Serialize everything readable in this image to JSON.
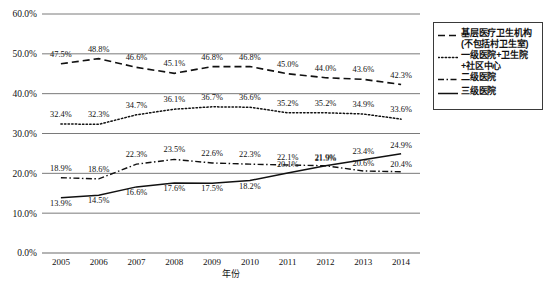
{
  "chart_data": {
    "type": "line",
    "title": "",
    "xlabel": "年份",
    "ylabel": "",
    "categories": [
      "2005",
      "2006",
      "2007",
      "2008",
      "2009",
      "2010",
      "2011",
      "2012",
      "2013",
      "2014"
    ],
    "ylim": [
      0,
      60
    ],
    "ytick_labels": [
      "0.0%",
      "10.0%",
      "20.0%",
      "30.0%",
      "40.0%",
      "50.0%",
      "60.0%"
    ],
    "ytick_values": [
      0,
      10,
      20,
      30,
      40,
      50,
      60
    ],
    "grid": true,
    "legend_position": "right",
    "value_suffix": "%",
    "series": [
      {
        "name": "基层医疗卫生机构\n(不包括村卫生室)",
        "style": "dashed",
        "color": "#111111",
        "values": [
          47.5,
          48.8,
          46.6,
          45.1,
          46.8,
          46.8,
          45.0,
          44.0,
          43.6,
          42.3
        ],
        "labels": [
          "47.5%",
          "48.8%",
          "46.6%",
          "45.1%",
          "46.8%",
          "46.8%",
          "45.0%",
          "44.0%",
          "43.6%",
          "42.3%"
        ]
      },
      {
        "name": "一级医院+卫生院\n+社区中心",
        "style": "dotted",
        "color": "#111111",
        "values": [
          32.4,
          32.3,
          34.7,
          36.1,
          36.7,
          36.6,
          35.2,
          35.2,
          34.9,
          33.6
        ],
        "labels": [
          "32.4%",
          "32.3%",
          "34.7%",
          "36.1%",
          "36.7%",
          "36.6%",
          "35.2%",
          "35.2%",
          "34.9%",
          "33.6%"
        ]
      },
      {
        "name": "二级医院",
        "style": "dashdot",
        "color": "#111111",
        "values": [
          18.9,
          18.6,
          22.3,
          23.5,
          22.6,
          22.3,
          22.1,
          21.9,
          20.6,
          20.4
        ],
        "labels": [
          "18.9%",
          "18.6%",
          "22.3%",
          "23.5%",
          "22.6%",
          "22.3%",
          "22.1%",
          "21.9%",
          "20.6%",
          "20.4%"
        ]
      },
      {
        "name": "三级医院",
        "style": "solid",
        "color": "#111111",
        "values": [
          13.9,
          14.5,
          16.6,
          17.6,
          17.5,
          18.2,
          20.1,
          21.9,
          23.4,
          24.9
        ],
        "labels": [
          "13.9%",
          "14.5%",
          "16.6%",
          "17.6%",
          "17.5%",
          "18.2%",
          "20.1%",
          "21.9%",
          "23.4%",
          "24.9%"
        ]
      }
    ]
  },
  "legend": {
    "items": [
      {
        "label": "基层医疗卫生机构\n(不包括村卫生室)",
        "style": "dashed"
      },
      {
        "label": "一级医院+卫生院\n+社区中心",
        "style": "dotted"
      },
      {
        "label": "二级医院",
        "style": "dashdot"
      },
      {
        "label": "三级医院",
        "style": "solid"
      }
    ]
  }
}
